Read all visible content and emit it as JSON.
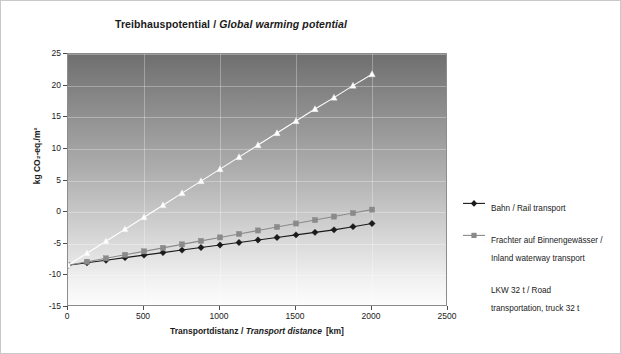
{
  "chart_data": {
    "type": "line",
    "title": "Treibhauspotential / Global warming potential",
    "title_de": "Treibhauspotential",
    "title_en": "Global warming potential",
    "xlabel": "Transportdistanz / Transport distance  [km]",
    "xlabel_de": "Transportdistanz",
    "xlabel_en": "Transport distance",
    "xunit": "[km]",
    "ylabel": "kg CO₂-eq./m²",
    "xlim": [
      0,
      2500
    ],
    "ylim": [
      -15,
      25
    ],
    "xticks": [
      0,
      500,
      1000,
      1500,
      2000,
      2500
    ],
    "yticks": [
      -15,
      -10,
      -5,
      0,
      5,
      10,
      15,
      20,
      25
    ],
    "grid": true,
    "legend_position": "right",
    "plot_background": "vertical gradient dark-gray to white",
    "x": [
      0,
      125,
      250,
      375,
      500,
      625,
      750,
      875,
      1000,
      1125,
      1250,
      1375,
      1500,
      1625,
      1750,
      1875,
      2000
    ],
    "series": [
      {
        "name": "Bahn / Rail transport",
        "name_de": "Bahn",
        "name_en": "Rail transport",
        "color": "#1a1a1a",
        "marker": "diamond",
        "values": [
          -8.4,
          -8.0,
          -7.6,
          -7.2,
          -6.8,
          -6.4,
          -6.0,
          -5.6,
          -5.2,
          -4.8,
          -4.4,
          -4.0,
          -3.6,
          -3.2,
          -2.8,
          -2.3,
          -1.8
        ]
      },
      {
        "name": "Frachter auf Binnengewässer /\nInland waterway transport",
        "name_de": "Frachter auf Binnengewässer",
        "name_en": "Inland waterway transport",
        "color": "#8a8a8a",
        "marker": "square",
        "values": [
          -8.4,
          -7.85,
          -7.3,
          -6.75,
          -6.2,
          -5.65,
          -5.1,
          -4.55,
          -4.0,
          -3.45,
          -2.9,
          -2.35,
          -1.8,
          -1.25,
          -0.7,
          -0.15,
          0.4
        ]
      },
      {
        "name": "LKW 32 t / Road\ntransportation, truck 32 t",
        "name_de": "LKW 32 t",
        "name_en": "Road transportation, truck 32 t",
        "color": "#ffffff",
        "marker": "triangle",
        "values": [
          -8.4,
          -6.5,
          -4.6,
          -2.7,
          -0.8,
          1.1,
          3.0,
          4.9,
          6.8,
          8.7,
          10.6,
          12.5,
          14.4,
          16.3,
          18.1,
          20.0,
          21.8
        ]
      }
    ]
  },
  "legend": {
    "items": [
      {
        "label": "Bahn / Rail transport"
      },
      {
        "label": "Frachter auf Binnengewässer /\nInland waterway transport"
      },
      {
        "label": "LKW 32 t / Road\ntransportation, truck 32 t"
      }
    ]
  }
}
